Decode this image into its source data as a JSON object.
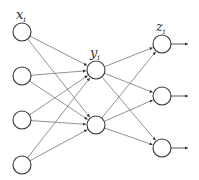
{
  "diagram": {
    "type": "feed-forward neural network",
    "layers": [
      {
        "name": "input",
        "label": "x",
        "subscript": "i",
        "x": 22,
        "nodes_y": [
          32,
          76,
          120,
          165
        ]
      },
      {
        "name": "hidden",
        "label": "y",
        "subscript": "i",
        "x": 96,
        "nodes_y": [
          70,
          125
        ]
      },
      {
        "name": "output",
        "label": "z",
        "subscript": "i",
        "x": 162,
        "nodes_y": [
          44,
          96,
          148
        ]
      }
    ],
    "node_radius": 9,
    "output_arrow_end_x": 188,
    "colors": {
      "node_stroke": "#333333",
      "edge": "#777777",
      "arrow": "#333333"
    }
  }
}
